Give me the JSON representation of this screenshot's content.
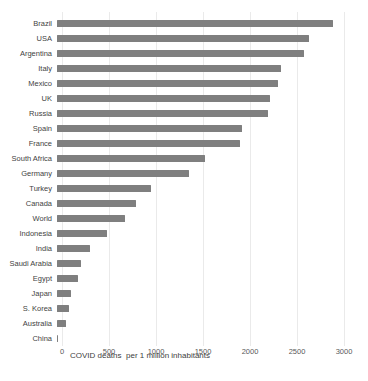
{
  "chart_data": {
    "type": "bar",
    "orientation": "horizontal",
    "title": "",
    "xlabel": "COVID deaths  per 1 million inhabitants",
    "ylabel": "",
    "categories": [
      "Brazil",
      "USA",
      "Argentina",
      "Italy",
      "Mexico",
      "UK",
      "Russia",
      "Spain",
      "France",
      "South Africa",
      "Germany",
      "Turkey",
      "Canada",
      "World",
      "Indonesia",
      "India",
      "Saudi Arabia",
      "Egypt",
      "Japan",
      "S. Korea",
      "Australia",
      "China"
    ],
    "values": [
      2885,
      2630,
      2580,
      2340,
      2310,
      2225,
      2205,
      1930,
      1915,
      1550,
      1380,
      985,
      825,
      710,
      525,
      350,
      255,
      220,
      150,
      125,
      95,
      5
    ],
    "xlim": [
      0,
      3000
    ],
    "xticks": [
      0,
      500,
      1000,
      1500,
      2000,
      2500,
      3000
    ],
    "grid": true,
    "legend": false,
    "colors": {
      "bar": "#7f7f7f",
      "gridline": "#eaeaea",
      "category_label": "#3f3f3f",
      "tick_label": "#595959",
      "axis_title": "#404040",
      "background": "#ffffff"
    }
  }
}
